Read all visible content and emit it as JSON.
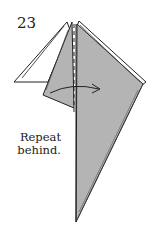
{
  "step_number": "23",
  "instruction_lines": [
    "Repeat",
    "behind."
  ],
  "colors": {
    "paper_gray": "#b4b4b4",
    "paper_white": "#ffffff",
    "line": "#222222"
  },
  "elements": {
    "valley_fold_line": "dashed vertical",
    "arrow": "curved arrow left-to-right"
  }
}
